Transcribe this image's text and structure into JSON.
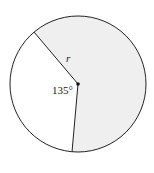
{
  "diagram": {
    "type": "circle-sector",
    "center_label": "",
    "radius_label": "r",
    "angle_label": "135°",
    "angle_degrees": 135,
    "colors": {
      "shaded_sector": "#efefef",
      "unshaded_sector": "#ffffff",
      "stroke": "#222222"
    }
  }
}
